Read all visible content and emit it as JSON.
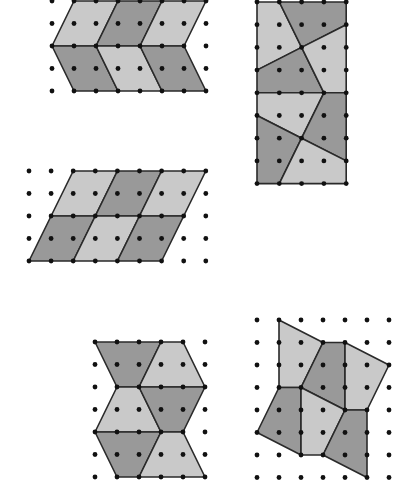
{
  "colors": {
    "dark": "#999999",
    "light": "#c9c9c9",
    "stroke": "#2a2a2a",
    "dot": "#111111"
  },
  "figures": [
    {
      "id": "chevron-tiling",
      "origin": [
        52,
        1
      ],
      "step": [
        22,
        22.5
      ],
      "cols": 8,
      "rows": 5,
      "tiles": [
        {
          "shade": "light",
          "pts": [
            [
              1,
              0
            ],
            [
              3,
              0
            ],
            [
              2,
              2
            ],
            [
              0,
              2
            ]
          ]
        },
        {
          "shade": "dark",
          "pts": [
            [
              3,
              0
            ],
            [
              5,
              0
            ],
            [
              4,
              2
            ],
            [
              2,
              2
            ]
          ]
        },
        {
          "shade": "light",
          "pts": [
            [
              5,
              0
            ],
            [
              7,
              0
            ],
            [
              6,
              2
            ],
            [
              4,
              2
            ]
          ]
        },
        {
          "shade": "dark",
          "pts": [
            [
              0,
              2
            ],
            [
              2,
              2
            ],
            [
              3,
              4
            ],
            [
              1,
              4
            ]
          ]
        },
        {
          "shade": "light",
          "pts": [
            [
              2,
              2
            ],
            [
              4,
              2
            ],
            [
              5,
              4
            ],
            [
              3,
              4
            ]
          ]
        },
        {
          "shade": "dark",
          "pts": [
            [
              4,
              2
            ],
            [
              6,
              2
            ],
            [
              7,
              4
            ],
            [
              5,
              4
            ]
          ]
        }
      ]
    },
    {
      "id": "rectangle-quadrilateral-tiling",
      "origin": [
        257,
        2
      ],
      "step": [
        22.3,
        22.7
      ],
      "cols": 5,
      "rows": 9,
      "tiles": [
        {
          "shade": "light",
          "pts": [
            [
              0,
              0
            ],
            [
              1,
              0
            ],
            [
              2,
              2
            ],
            [
              0,
              3
            ]
          ]
        },
        {
          "shade": "dark",
          "pts": [
            [
              1,
              0
            ],
            [
              4,
              0
            ],
            [
              4,
              1
            ],
            [
              2,
              2
            ]
          ]
        },
        {
          "shade": "dark",
          "pts": [
            [
              0,
              3
            ],
            [
              2,
              2
            ],
            [
              3,
              4
            ],
            [
              0,
              4
            ]
          ]
        },
        {
          "shade": "light",
          "pts": [
            [
              2,
              2
            ],
            [
              4,
              1
            ],
            [
              4,
              4
            ],
            [
              3,
              4
            ]
          ]
        },
        {
          "shade": "light",
          "pts": [
            [
              0,
              4
            ],
            [
              3,
              4
            ],
            [
              2,
              6
            ],
            [
              0,
              5
            ]
          ]
        },
        {
          "shade": "dark",
          "pts": [
            [
              3,
              4
            ],
            [
              4,
              4
            ],
            [
              4,
              7
            ],
            [
              2,
              6
            ]
          ]
        },
        {
          "shade": "dark",
          "pts": [
            [
              0,
              5
            ],
            [
              2,
              6
            ],
            [
              1,
              8
            ],
            [
              0,
              8
            ]
          ]
        },
        {
          "shade": "light",
          "pts": [
            [
              2,
              6
            ],
            [
              4,
              7
            ],
            [
              4,
              8
            ],
            [
              1,
              8
            ]
          ]
        }
      ]
    },
    {
      "id": "parallelogram-tiling",
      "origin": [
        29,
        171
      ],
      "step": [
        22.1,
        22.5
      ],
      "cols": 9,
      "rows": 5,
      "tiles": [
        {
          "shade": "light",
          "pts": [
            [
              2,
              0
            ],
            [
              4,
              0
            ],
            [
              3,
              2
            ],
            [
              1,
              2
            ]
          ]
        },
        {
          "shade": "dark",
          "pts": [
            [
              4,
              0
            ],
            [
              6,
              0
            ],
            [
              5,
              2
            ],
            [
              3,
              2
            ]
          ]
        },
        {
          "shade": "light",
          "pts": [
            [
              6,
              0
            ],
            [
              8,
              0
            ],
            [
              7,
              2
            ],
            [
              5,
              2
            ]
          ]
        },
        {
          "shade": "dark",
          "pts": [
            [
              1,
              2
            ],
            [
              3,
              2
            ],
            [
              2,
              4
            ],
            [
              0,
              4
            ]
          ]
        },
        {
          "shade": "light",
          "pts": [
            [
              3,
              2
            ],
            [
              5,
              2
            ],
            [
              4,
              4
            ],
            [
              2,
              4
            ]
          ]
        },
        {
          "shade": "dark",
          "pts": [
            [
              5,
              2
            ],
            [
              7,
              2
            ],
            [
              6,
              4
            ],
            [
              4,
              4
            ]
          ]
        }
      ]
    },
    {
      "id": "trapezoid-tiling",
      "origin": [
        95,
        342
      ],
      "step": [
        22,
        22.5
      ],
      "cols": 6,
      "rows": 7,
      "tiles": [
        {
          "shade": "dark",
          "pts": [
            [
              0,
              0
            ],
            [
              3,
              0
            ],
            [
              2,
              2
            ],
            [
              1,
              2
            ]
          ]
        },
        {
          "shade": "light",
          "pts": [
            [
              3,
              0
            ],
            [
              4,
              0
            ],
            [
              5,
              2
            ],
            [
              2,
              2
            ]
          ]
        },
        {
          "shade": "light",
          "pts": [
            [
              1,
              2
            ],
            [
              2,
              2
            ],
            [
              3,
              4
            ],
            [
              0,
              4
            ]
          ]
        },
        {
          "shade": "dark",
          "pts": [
            [
              2,
              2
            ],
            [
              5,
              2
            ],
            [
              4,
              4
            ],
            [
              3,
              4
            ]
          ]
        },
        {
          "shade": "dark",
          "pts": [
            [
              0,
              4
            ],
            [
              3,
              4
            ],
            [
              2,
              6
            ],
            [
              1,
              6
            ]
          ]
        },
        {
          "shade": "light",
          "pts": [
            [
              3,
              4
            ],
            [
              4,
              4
            ],
            [
              5,
              6
            ],
            [
              2,
              6
            ]
          ]
        }
      ]
    },
    {
      "id": "irregular-quadrilateral-tiling",
      "origin": [
        257,
        320
      ],
      "step": [
        22,
        22.5
      ],
      "cols": 7,
      "rows": 8,
      "tiles": [
        {
          "shade": "light",
          "pts": [
            [
              1,
              0
            ],
            [
              3,
              1
            ],
            [
              2,
              3
            ],
            [
              1,
              3
            ]
          ]
        },
        {
          "shade": "dark",
          "pts": [
            [
              3,
              1
            ],
            [
              4,
              1
            ],
            [
              4,
              4
            ],
            [
              2,
              3
            ]
          ]
        },
        {
          "shade": "light",
          "pts": [
            [
              4,
              1
            ],
            [
              6,
              2
            ],
            [
              5,
              4
            ],
            [
              4,
              4
            ]
          ]
        },
        {
          "shade": "dark",
          "pts": [
            [
              1,
              3
            ],
            [
              2,
              3
            ],
            [
              2,
              6
            ],
            [
              0,
              5
            ]
          ]
        },
        {
          "shade": "light",
          "pts": [
            [
              2,
              3
            ],
            [
              4,
              4
            ],
            [
              3,
              6
            ],
            [
              2,
              6
            ]
          ]
        },
        {
          "shade": "dark",
          "pts": [
            [
              4,
              4
            ],
            [
              5,
              4
            ],
            [
              5,
              7
            ],
            [
              3,
              6
            ]
          ]
        }
      ]
    }
  ]
}
